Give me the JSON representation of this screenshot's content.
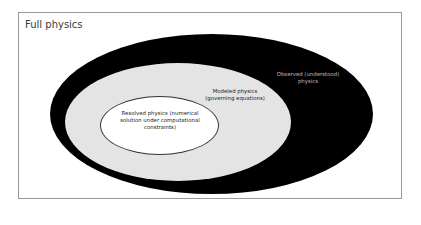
{
  "diagram": {
    "title": "Full physics",
    "regions": [
      {
        "id": "observed",
        "label_line1": "Observed (understood)",
        "label_line2": "physics",
        "fill": "#000000"
      },
      {
        "id": "modeled",
        "label_line1": "Modeled physics",
        "label_line2": "(governing equations)",
        "fill": "#e4e4e4"
      },
      {
        "id": "resolved",
        "label_line1": "Resolved physics (numerical",
        "label_line2": "solution under computational",
        "label_line3": "constraints)",
        "fill": "#ffffff"
      }
    ]
  }
}
